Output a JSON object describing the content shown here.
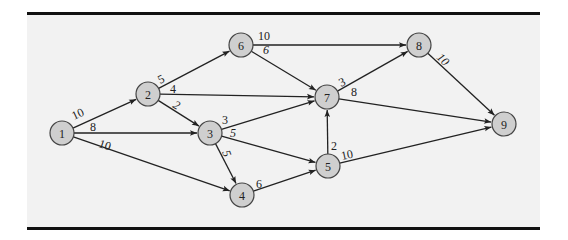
{
  "diagram": {
    "type": "directed-network",
    "nodes": [
      {
        "id": "1",
        "label": "1",
        "x": 62,
        "y": 133
      },
      {
        "id": "2",
        "label": "2",
        "x": 148,
        "y": 94
      },
      {
        "id": "3",
        "label": "3",
        "x": 210,
        "y": 133
      },
      {
        "id": "4",
        "label": "4",
        "x": 242,
        "y": 195
      },
      {
        "id": "5",
        "label": "5",
        "x": 328,
        "y": 166
      },
      {
        "id": "6",
        "label": "6",
        "x": 241,
        "y": 45
      },
      {
        "id": "7",
        "label": "7",
        "x": 327,
        "y": 97
      },
      {
        "id": "8",
        "label": "8",
        "x": 419,
        "y": 45
      },
      {
        "id": "9",
        "label": "9",
        "x": 504,
        "y": 124
      }
    ],
    "edges": [
      {
        "from": "1",
        "to": "2",
        "weight": "10",
        "lx": 74,
        "ly": 120,
        "rot": -25
      },
      {
        "from": "1",
        "to": "3",
        "weight": "8",
        "lx": 90,
        "ly": 131,
        "rot": 0
      },
      {
        "from": "1",
        "to": "4",
        "weight": "10",
        "lx": 98,
        "ly": 147,
        "rot": 18
      },
      {
        "from": "2",
        "to": "6",
        "weight": "5",
        "lx": 160,
        "ly": 84,
        "rot": -25
      },
      {
        "from": "2",
        "to": "7",
        "weight": "4",
        "lx": 170,
        "ly": 93,
        "rot": 0
      },
      {
        "from": "2",
        "to": "3",
        "weight": "2",
        "lx": 172,
        "ly": 107,
        "rot": 30,
        "italic": true
      },
      {
        "from": "3",
        "to": "7",
        "weight": "3",
        "lx": 222,
        "ly": 124,
        "rot": 0
      },
      {
        "from": "3",
        "to": "5",
        "weight": "5",
        "lx": 230,
        "ly": 137,
        "rot": 0,
        "italic": true
      },
      {
        "from": "3",
        "to": "4",
        "weight": "5",
        "lx": 222,
        "ly": 152,
        "rot": 70,
        "italic": true
      },
      {
        "from": "4",
        "to": "5",
        "weight": "6",
        "lx": 256,
        "ly": 188,
        "rot": 0
      },
      {
        "from": "5",
        "to": "7",
        "weight": "2",
        "lx": 331,
        "ly": 150,
        "rot": 0
      },
      {
        "from": "5",
        "to": "9",
        "weight": "10",
        "lx": 342,
        "ly": 160,
        "rot": -12
      },
      {
        "from": "6",
        "to": "8",
        "weight": "10",
        "lx": 258,
        "ly": 40,
        "rot": 0
      },
      {
        "from": "6",
        "to": "7",
        "weight": "6",
        "lx": 263,
        "ly": 54,
        "rot": 0,
        "italic": true
      },
      {
        "from": "7",
        "to": "8",
        "weight": "3",
        "lx": 341,
        "ly": 87,
        "rot": -25
      },
      {
        "from": "7",
        "to": "9",
        "weight": "8",
        "lx": 351,
        "ly": 96,
        "rot": 0
      },
      {
        "from": "8",
        "to": "9",
        "weight": "10",
        "lx": 436,
        "ly": 58,
        "rot": 45,
        "italic": true
      }
    ],
    "node_radius": 12,
    "colors": {
      "node_fill": "#cfcfcf",
      "node_stroke": "#444444",
      "edge": "#222222",
      "panel": "#f2f2f2",
      "rule": "#111111"
    }
  }
}
